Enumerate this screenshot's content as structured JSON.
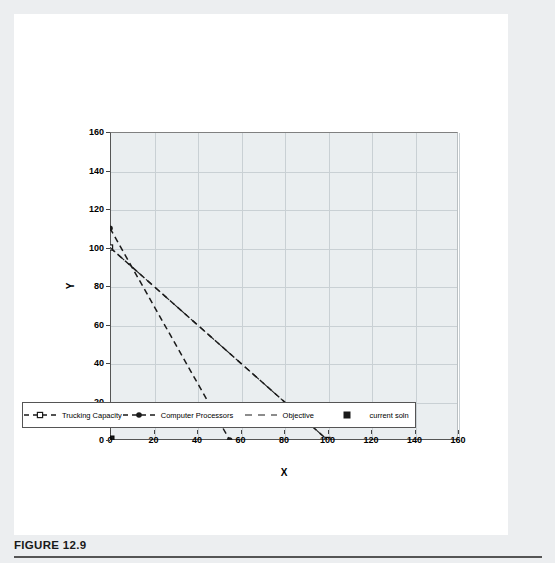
{
  "caption": {
    "label": "FIGURE 12.9"
  },
  "chart_data": {
    "type": "line",
    "title": "",
    "xlabel": "X",
    "ylabel": "Y",
    "xlim": [
      0,
      160
    ],
    "ylim": [
      0,
      160
    ],
    "xticks": [
      0,
      20,
      40,
      60,
      80,
      100,
      120,
      140,
      160
    ],
    "yticks": [
      0,
      20,
      40,
      60,
      80,
      100,
      120,
      140,
      160
    ],
    "grid": true,
    "legend_position": "bottom",
    "series": [
      {
        "name": "Trucking Capacity",
        "style": "dashed",
        "marker": "square",
        "points": [
          [
            0,
            100
          ],
          [
            100,
            0
          ]
        ]
      },
      {
        "name": "Computer Processors",
        "style": "dashed",
        "marker": "circle",
        "points": [
          [
            0,
            110
          ],
          [
            55,
            0
          ]
        ]
      },
      {
        "name": "Objective",
        "style": "dashed",
        "marker": "none",
        "points": [
          [
            0,
            100
          ],
          [
            100,
            0
          ]
        ]
      },
      {
        "name": "current soln",
        "style": "none",
        "marker": "filled-square",
        "points": [
          [
            0,
            0
          ]
        ]
      }
    ]
  }
}
